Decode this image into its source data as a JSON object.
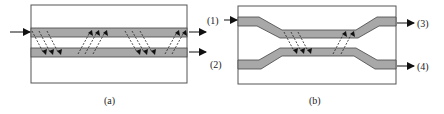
{
  "figure": {
    "panels": [
      {
        "id": "a",
        "caption": "(a)",
        "description": "Two parallel straight waveguides with bidirectional coupling arrows",
        "output_labels": [
          "(1)",
          "(2)"
        ]
      },
      {
        "id": "b",
        "caption": "(b)",
        "description": "Directional coupler with S-bend waveguides converging in the center coupling region",
        "input_labels": [
          "(1)",
          "(2)"
        ],
        "output_labels": [
          "(3)",
          "(4)"
        ]
      }
    ]
  },
  "colors": {
    "waveguide_fill": "#a8a8a8",
    "outline": "#333333",
    "arrow": "#111111",
    "background": "#ffffff"
  },
  "labels": {
    "a_out1": "(1)",
    "a_out2": "(2)",
    "b_out3": "(3)",
    "b_out4": "(4)",
    "caption_a": "(a)",
    "caption_b": "(b)"
  }
}
